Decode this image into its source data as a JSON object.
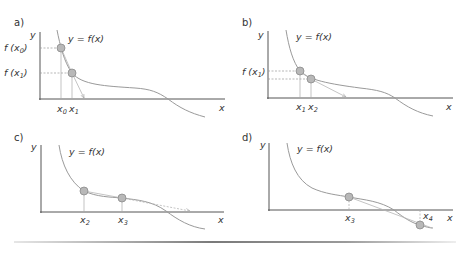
{
  "figure": {
    "curve_label": "y = f(x)",
    "axis_labels": {
      "x": "x",
      "y": "y"
    },
    "colors": {
      "axis": "#555555",
      "curve": "#9a9a9a",
      "point_fill": "#b8b8b8",
      "point_stroke": "#8a8a8a",
      "tangent": "#b5b5b5"
    },
    "panels": [
      {
        "id": "a",
        "label": "a)",
        "y_ticks": [
          {
            "base": "f (x",
            "sub": "0",
            "close": ")"
          },
          {
            "base": "f (x",
            "sub": "1",
            "close": ")"
          }
        ],
        "x_ticks": [
          {
            "base": "x",
            "sub": "0"
          },
          {
            "base": "x",
            "sub": "1"
          }
        ]
      },
      {
        "id": "b",
        "label": "b)",
        "y_ticks": [
          {
            "base": "f (x",
            "sub": "1",
            "close": ")"
          }
        ],
        "x_ticks": [
          {
            "base": "x",
            "sub": "1"
          },
          {
            "base": "x",
            "sub": "2"
          }
        ]
      },
      {
        "id": "c",
        "label": "c)",
        "y_ticks": [],
        "x_ticks": [
          {
            "base": "x",
            "sub": "2"
          },
          {
            "base": "x",
            "sub": "3"
          }
        ]
      },
      {
        "id": "d",
        "label": "d)",
        "y_ticks": [],
        "x_ticks": [
          {
            "base": "x",
            "sub": "3"
          },
          {
            "base": "x",
            "sub": "4"
          }
        ]
      }
    ]
  }
}
